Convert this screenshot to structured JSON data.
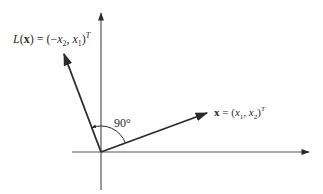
{
  "diagram": {
    "type": "vector-rotation",
    "colors": {
      "ink": "#2a2a2a",
      "background": "#ffffff"
    },
    "origin": [
      101,
      152
    ],
    "axes": {
      "horizontal": {
        "from": [
          72,
          152
        ],
        "to": [
          309,
          152
        ]
      },
      "vertical": {
        "from": [
          101,
          190
        ],
        "to": [
          101,
          13
        ]
      }
    },
    "vectors": [
      {
        "name": "x",
        "to": [
          207,
          113
        ]
      },
      {
        "name": "L(x)",
        "to": [
          64,
          54
        ]
      }
    ],
    "angle": {
      "label": "90°",
      "radius": 26
    },
    "labels": {
      "Lx": {
        "func": "L",
        "open": "(",
        "var": "x",
        "mid": ") = (−",
        "a": "x",
        "a_sub": "2",
        "sep": ", ",
        "b": "x",
        "b_sub": "1",
        "close": ")",
        "sup": "T"
      },
      "x": {
        "var": "x",
        "eq": " = (",
        "a": "x",
        "a_sub": "1",
        "sep": ", ",
        "b": "x",
        "b_sub": "2",
        "close": ")",
        "sup": "T"
      },
      "angle": "90°"
    }
  }
}
